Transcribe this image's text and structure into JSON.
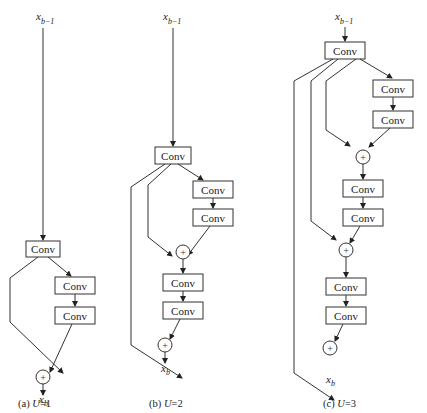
{
  "figure": {
    "conv_label": "Conv",
    "plus_symbol": "+",
    "input_var": "x",
    "input_sub": "b−1",
    "output_var": "x",
    "output_sub": "b",
    "panels": [
      {
        "id": "a",
        "caption_prefix": "(a) ",
        "caption_var": "U",
        "caption_suffix": "=1",
        "conv_count": 3,
        "add_count": 1
      },
      {
        "id": "b",
        "caption_prefix": "(b) ",
        "caption_var": "U",
        "caption_suffix": "=2",
        "conv_count": 5,
        "add_count": 2
      },
      {
        "id": "c",
        "caption_prefix": "(c) ",
        "caption_var": "U",
        "caption_suffix": "=3",
        "conv_count": 7,
        "add_count": 3
      }
    ]
  },
  "colors": {
    "stroke": "#333333",
    "background": "#ffffff"
  }
}
